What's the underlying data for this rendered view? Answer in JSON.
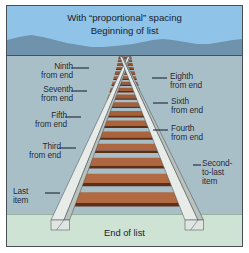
{
  "figure": {
    "type": "perspective-diagram",
    "title_line1": "With “proportional” spacing",
    "title_line2": "Beginning of list",
    "footer": "End of list",
    "colors": {
      "sky": "#8fc3e8",
      "mountain": "#6f93ac",
      "midground": "#a8bfc8",
      "ground": "#cfe3d4",
      "tie": "#8f4d2c",
      "tie_dark": "#5e2f18",
      "tie_light": "#a9693f",
      "rail": "#e8ece9",
      "rail_shade": "#b9c2bd",
      "rail_edge": "#4d5359",
      "border": "#4a4f55",
      "text": "#16222e",
      "leader": "#16222e"
    },
    "geometry": {
      "vanishing_x": 122,
      "vanishing_y": 52,
      "horizon_y": 52,
      "midground_top_y": 52,
      "ground_top_y": 214,
      "rail_left_bottom_x": 40,
      "rail_right_bottom_x": 208,
      "bottom_y": 224
    }
  },
  "labels": {
    "left": [
      {
        "id": "ninth",
        "text": "Ninth\nfrom end",
        "x": 13,
        "y": 63,
        "w": 58,
        "leader_x": 73,
        "leader_y": 67,
        "leader_w": 18
      },
      {
        "id": "seventh",
        "text": "Seventh\nfrom end",
        "x": 3,
        "y": 86,
        "w": 68,
        "leader_x": 73,
        "leader_y": 90,
        "leader_w": 16
      },
      {
        "id": "fifth",
        "text": "Fifth\nfrom end",
        "x": 3,
        "y": 112,
        "w": 62,
        "leader_x": 67,
        "leader_y": 116,
        "leader_w": 16
      },
      {
        "id": "third",
        "text": "Third\nfrom end",
        "x": 3,
        "y": 143,
        "w": 56,
        "leader_x": 61,
        "leader_y": 147,
        "leader_w": 17
      },
      {
        "id": "last",
        "text": "Last\nitem",
        "x": 9,
        "y": 188,
        "w": 36,
        "leader_x": 47,
        "leader_y": 192,
        "leader_w": 15
      }
    ],
    "right": [
      {
        "id": "eighth",
        "text": "Eighth\nfrom end",
        "x": 172,
        "y": 73,
        "leader_x": 154,
        "leader_y": 77,
        "leader_w": 15
      },
      {
        "id": "sixth",
        "text": "Sixth\nfrom end",
        "x": 176,
        "y": 98,
        "leader_x": 155,
        "leader_y": 102,
        "leader_w": 15
      },
      {
        "id": "fourth",
        "text": "Fourth\nfrom end",
        "x": 176,
        "y": 125,
        "leader_x": 155,
        "leader_y": 129,
        "leader_w": 15
      },
      {
        "id": "second-to-last",
        "text": "Second-\nto-last\nitem",
        "x": 205,
        "y": 160,
        "leader_x": 195,
        "leader_y": 164,
        "leader_w": 9
      }
    ]
  },
  "ties": [
    {
      "index": 1,
      "label": "Beginning of list"
    },
    {
      "index": 2,
      "label": ""
    },
    {
      "index": 3,
      "label": ""
    },
    {
      "index": 4,
      "label": ""
    },
    {
      "index": 5,
      "label": ""
    },
    {
      "index": 6,
      "label": ""
    },
    {
      "index": 7,
      "label": ""
    },
    {
      "index": 8,
      "label": ""
    },
    {
      "index": 9,
      "label": "Ninth from end"
    },
    {
      "index": 10,
      "label": "Eighth from end"
    },
    {
      "index": 11,
      "label": "Seventh from end"
    },
    {
      "index": 12,
      "label": "Sixth from end"
    },
    {
      "index": 13,
      "label": "Fifth from end"
    },
    {
      "index": 14,
      "label": "Fourth from end"
    },
    {
      "index": 15,
      "label": "Third from end"
    },
    {
      "index": 16,
      "label": "Second-to-last item"
    },
    {
      "index": 17,
      "label": "Last item"
    }
  ]
}
